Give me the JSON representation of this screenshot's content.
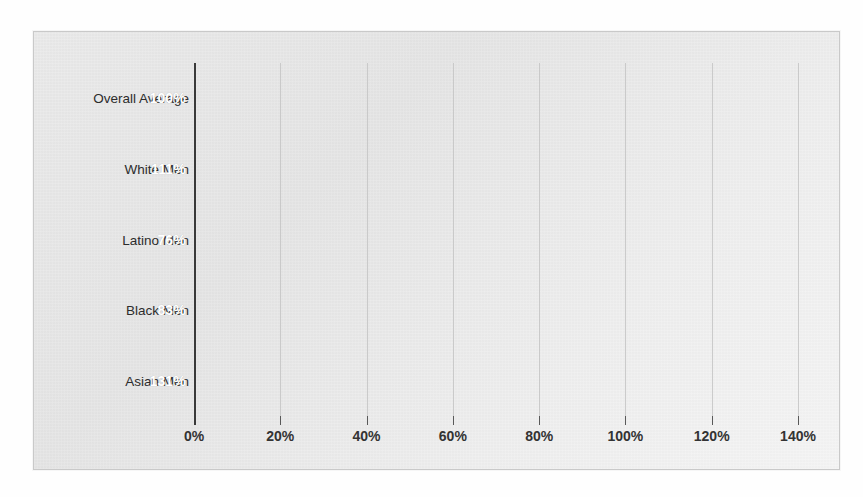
{
  "chart_data": {
    "type": "bar",
    "orientation": "horizontal",
    "title": "",
    "subtitle": "",
    "xlabel": "",
    "ylabel": "",
    "categories": [
      "Overall Average",
      "White Men",
      "Latino Men",
      "Black Men",
      "Asian Men"
    ],
    "values": [
      100,
      111,
      76,
      83,
      131
    ],
    "value_labels": [
      "100%",
      "111%",
      "76%",
      "83%",
      "131%"
    ],
    "xlim": [
      0,
      140
    ],
    "x_ticks": [
      0,
      20,
      40,
      60,
      80,
      100,
      120,
      140
    ],
    "x_tick_labels": [
      "0%",
      "20%",
      "40%",
      "60%",
      "80%",
      "100%",
      "120%",
      "140%"
    ],
    "grid": "vertical-only",
    "legend": "none",
    "series": [
      {
        "name": "",
        "values": [
          100,
          111,
          76,
          83,
          131
        ]
      }
    ]
  },
  "style": {
    "bar_color": "#939393",
    "value_label_color": "#ffffff",
    "axis_color": "#3a3a3a",
    "gridline_color": "#c4c4c4",
    "panel_background": "#e9e9e9",
    "tick_label_color": "#333333",
    "category_label_color": "#2c2c2c"
  }
}
